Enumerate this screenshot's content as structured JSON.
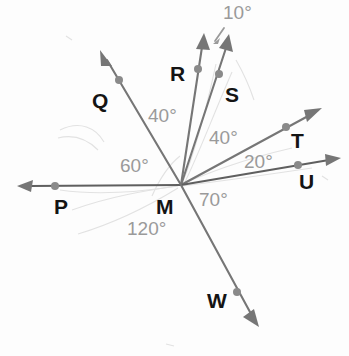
{
  "figure": {
    "kind": "geometry-diagram",
    "background_color": "#fdfdfd",
    "ray_color": "#767676",
    "ray_color_dark": "#5f5f5f",
    "point_label_color": "#141414",
    "angle_label_color": "#9a9a9a",
    "artifact_color": "#dedede"
  },
  "vertex": {
    "name": "M",
    "label": "M",
    "x": 181,
    "y": 185,
    "label_x": 156,
    "label_y": 196
  },
  "rays": [
    {
      "name": "ray-P",
      "label": "P",
      "tip_x": 17,
      "tip_y": 186,
      "dot_x": 55,
      "dot_y": 186,
      "label_x": 54,
      "label_y": 196,
      "bearing_deg": 180
    },
    {
      "name": "ray-Q",
      "label": "Q",
      "tip_x": 100,
      "tip_y": 50,
      "dot_x": 119,
      "dot_y": 80,
      "label_x": 92,
      "label_y": 90,
      "bearing_deg": 120
    },
    {
      "name": "ray-R",
      "label": "R",
      "tip_x": 204,
      "tip_y": 33,
      "dot_x": 198,
      "dot_y": 69,
      "label_x": 170,
      "label_y": 63,
      "bearing_deg": 80
    },
    {
      "name": "ray-S",
      "label": "S",
      "tip_x": 229,
      "tip_y": 34,
      "dot_x": 219,
      "dot_y": 74,
      "label_x": 225,
      "label_y": 84,
      "bearing_deg": 70
    },
    {
      "name": "ray-T",
      "label": "T",
      "tip_x": 322,
      "tip_y": 108,
      "dot_x": 286,
      "dot_y": 127,
      "label_x": 291,
      "label_y": 130,
      "bearing_deg": 30
    },
    {
      "name": "ray-U",
      "label": "U",
      "tip_x": 341,
      "tip_y": 158,
      "dot_x": 298,
      "dot_y": 165,
      "label_x": 299,
      "label_y": 171,
      "bearing_deg": 10
    },
    {
      "name": "ray-W",
      "label": "W",
      "tip_x": 259,
      "tip_y": 327,
      "dot_x": 237,
      "dot_y": 292,
      "label_x": 207,
      "label_y": 290,
      "bearing_deg": -60
    }
  ],
  "angles": [
    {
      "name": "angle-QR",
      "value": "40°",
      "between": [
        "Q",
        "R"
      ],
      "x": 148,
      "y": 106
    },
    {
      "name": "angle-ST",
      "value": "40°",
      "between": [
        "S",
        "T"
      ],
      "x": 209,
      "y": 128
    },
    {
      "name": "angle-PQ",
      "value": "60°",
      "between": [
        "P",
        "Q"
      ],
      "x": 120,
      "y": 156
    },
    {
      "name": "angle-TU",
      "value": "20°",
      "between": [
        "T",
        "U"
      ],
      "x": 244,
      "y": 152
    },
    {
      "name": "angle-UW",
      "value": "70°",
      "between": [
        "U",
        "W"
      ],
      "x": 199,
      "y": 190
    },
    {
      "name": "angle-PW",
      "value": "120°",
      "between": [
        "P",
        "W"
      ],
      "x": 127,
      "y": 219
    },
    {
      "name": "angle-RS",
      "value": "10°",
      "between": [
        "R",
        "S"
      ],
      "x": 223,
      "y": 3
    }
  ],
  "callout": {
    "name": "angle-RS-pointer",
    "from_x": 224,
    "from_y": 28,
    "to_x": 213,
    "to_y": 44
  }
}
